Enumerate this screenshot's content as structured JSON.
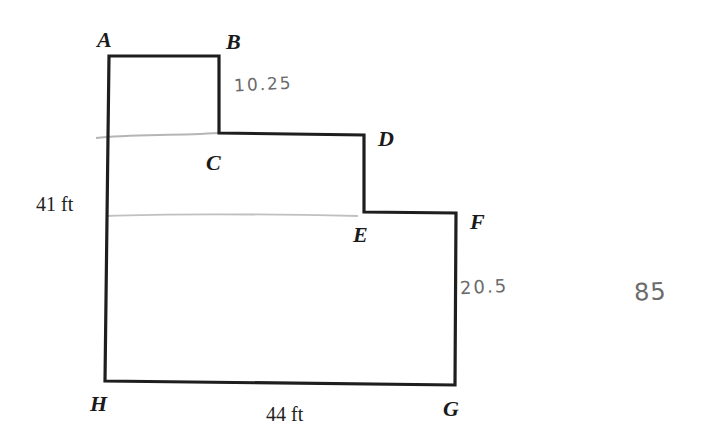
{
  "diagram": {
    "type": "floor-plan-polygon",
    "vertices": [
      {
        "id": "A",
        "label": "A",
        "x": 109,
        "y": 56
      },
      {
        "id": "B",
        "label": "B",
        "x": 219,
        "y": 56
      },
      {
        "id": "C",
        "label": "C",
        "x": 219,
        "y": 133
      },
      {
        "id": "D",
        "label": "D",
        "x": 364,
        "y": 135
      },
      {
        "id": "E",
        "label": "E",
        "x": 364,
        "y": 212
      },
      {
        "id": "F",
        "label": "F",
        "x": 456,
        "y": 213
      },
      {
        "id": "G",
        "label": "G",
        "x": 455,
        "y": 385
      },
      {
        "id": "H",
        "label": "H",
        "x": 105,
        "y": 381
      }
    ],
    "dimensions": {
      "left_side": "41 ft",
      "bottom_side": "44 ft"
    },
    "handwritten_notes": {
      "bc_length": "10.25",
      "fg_length": "20.5",
      "total": "85"
    },
    "colors": {
      "outline": "#1e1e1e",
      "pencil": "#a8a8a8",
      "handwriting": "#6b6b6b"
    }
  }
}
